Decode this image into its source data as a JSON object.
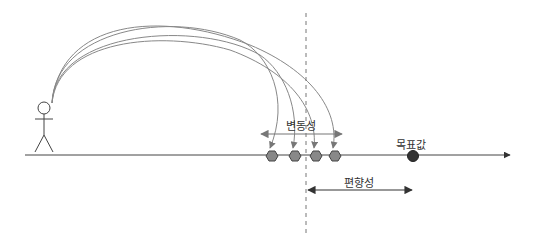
{
  "labels": {
    "variance": "변동성",
    "bias": "편향성",
    "target": "목표값"
  },
  "colors": {
    "line": "#444444",
    "arc": "#888888",
    "hexagon_fill": "#888888",
    "hexagon_stroke": "#444444",
    "target_fill": "#333333",
    "dashed": "#777777"
  },
  "shots": [
    272,
    295,
    316,
    335
  ],
  "target_x": 413
}
